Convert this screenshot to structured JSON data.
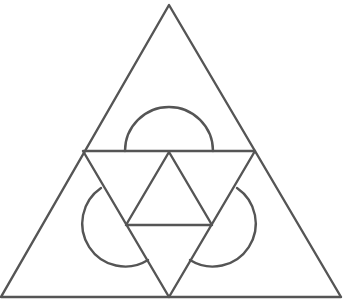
{
  "diagram": {
    "title": "",
    "stroke_color": "#555555",
    "stroke_width": 2.4,
    "background": "#ffffff",
    "outer_triangle": {
      "points": [
        [
          169,
          5
        ],
        [
          1,
          297
        ],
        [
          341,
          297
        ]
      ]
    },
    "midline_triangle": {
      "points": [
        [
          83,
          151
        ],
        [
          255,
          151
        ],
        [
          169,
          297
        ]
      ]
    },
    "inner_triangle": {
      "points": [
        [
          169,
          152
        ],
        [
          126,
          225
        ],
        [
          212,
          225
        ]
      ]
    },
    "semicircles": [
      {
        "name": "top",
        "d": "M125 151 A44 44 0 0 1 213 151"
      },
      {
        "name": "left",
        "d": "M101 188 A43 43 0 0 0 148 260"
      },
      {
        "name": "right",
        "d": "M237 188 A43 43 0 0 1 190 260"
      }
    ]
  }
}
